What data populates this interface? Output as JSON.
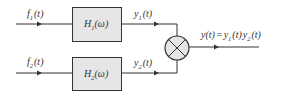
{
  "diagram": {
    "type": "block-diagram",
    "colors": {
      "line": "#333333",
      "block_fill": "#e6e6e6",
      "multiplier_fill": "#e4e4e4",
      "background": "#ffffff"
    },
    "inputs": [
      {
        "name": "f",
        "sub": "1",
        "arg": "(t)"
      },
      {
        "name": "f",
        "sub": "2",
        "arg": "(t)"
      }
    ],
    "blocks": [
      {
        "name": "H",
        "sub": "1",
        "arg": "(ω)"
      },
      {
        "name": "H",
        "sub": "2",
        "arg": "(ω)"
      }
    ],
    "intermediate": [
      {
        "name": "y",
        "sub": "1",
        "arg": "(t)"
      },
      {
        "name": "y",
        "sub": "2",
        "arg": "(t)"
      }
    ],
    "multiplier": {
      "symbol": "×"
    },
    "output": {
      "lhs": "y(t)",
      "eq": "=",
      "t1_name": "y",
      "t1_sub": "1",
      "t1_arg": "(t)",
      "t2_name": "y",
      "t2_sub": "2",
      "t2_arg": "(t)"
    }
  }
}
